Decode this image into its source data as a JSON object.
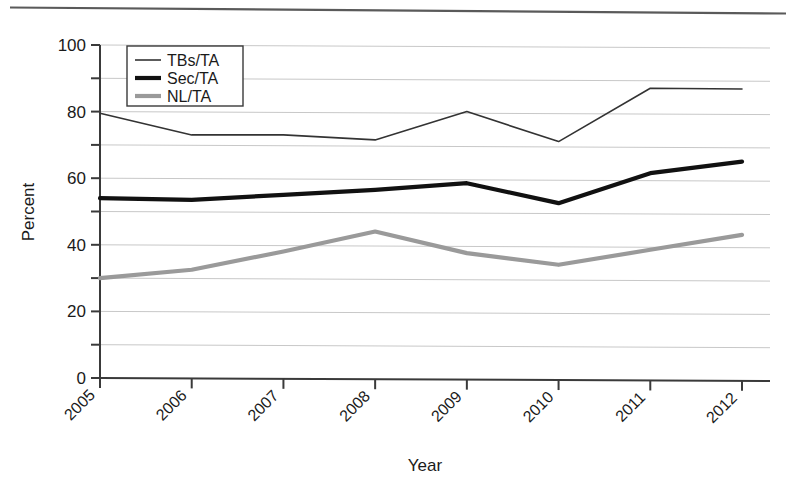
{
  "chart_data": {
    "type": "line",
    "title": "",
    "xlabel": "Year",
    "ylabel": "Percent",
    "categories": [
      "2005",
      "2006",
      "2007",
      "2008",
      "2009",
      "2010",
      "2011",
      "2012"
    ],
    "x": [
      2005,
      2006,
      2007,
      2008,
      2009,
      2010,
      2011,
      2012
    ],
    "xlim": [
      2005,
      2012
    ],
    "ylim": [
      0,
      100
    ],
    "ytick_labels": [
      "0",
      "20",
      "40",
      "60",
      "80",
      "100"
    ],
    "yticks": [
      0,
      20,
      40,
      60,
      80,
      100
    ],
    "yminor_ticks": [
      10,
      30,
      50,
      70,
      90
    ],
    "gridlines": [
      10,
      20,
      30,
      40,
      50,
      60,
      70,
      80,
      90,
      100
    ],
    "grid": true,
    "legend_position": "upper-left",
    "series": [
      {
        "name": "TBs/TA",
        "color": "#333333",
        "line_width": 1.6,
        "values": [
          79.5,
          73.0,
          73.0,
          71.5,
          80.0,
          71.0,
          87.0,
          86.8
        ]
      },
      {
        "name": "Sec/TA",
        "color": "#111111",
        "line_width": 4.2,
        "values": [
          54.0,
          53.5,
          55.0,
          56.5,
          58.5,
          52.5,
          61.5,
          65.0
        ]
      },
      {
        "name": "NL/TA",
        "color": "#9a9a9a",
        "line_width": 4.2,
        "values": [
          30.0,
          32.5,
          38.0,
          44.0,
          37.5,
          34.0,
          38.5,
          43.0
        ]
      }
    ]
  },
  "legend": {
    "items": [
      {
        "label": "TBs/TA"
      },
      {
        "label": "Sec/TA"
      },
      {
        "label": "NL/TA"
      }
    ]
  },
  "axes": {
    "y_title": "Percent",
    "x_title": "Year"
  },
  "colors": {
    "grid": "#c8c8c8",
    "axis": "#3a3a3a",
    "background": "#ffffff",
    "tbs_ta": "#333333",
    "sec_ta": "#111111",
    "nl_ta": "#9a9a9a"
  }
}
